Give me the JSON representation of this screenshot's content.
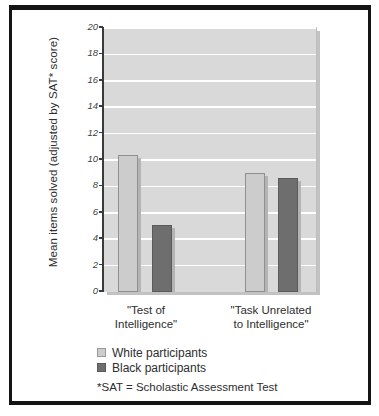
{
  "chart_data": {
    "type": "bar",
    "title": "",
    "xlabel": "",
    "ylabel": "Mean items solved (adjusted by SAT* score)",
    "ylim": [
      0,
      20
    ],
    "yticks": [
      0,
      2,
      4,
      6,
      8,
      10,
      12,
      14,
      16,
      18,
      20
    ],
    "ytick_labels": [
      "0",
      "2",
      "4",
      "6",
      "8",
      "10",
      "12",
      "14",
      "16",
      "18",
      "20"
    ],
    "grid": true,
    "legend_position": "below-axes-left",
    "categories": [
      "\"Test of Intelligence\"",
      "\"Task Unrelated to Intelligence\""
    ],
    "category_lines": [
      [
        "\"Test of",
        "Intelligence\""
      ],
      [
        "\"Task Unrelated",
        "to Intelligence\""
      ]
    ],
    "series": [
      {
        "name": "White participants",
        "color": "#cccccc",
        "values": [
          10.4,
          9.0
        ]
      },
      {
        "name": "Black participants",
        "color": "#6e6e6e",
        "values": [
          5.05,
          8.6
        ]
      }
    ],
    "annotations": [
      "*SAT = Scholastic Assessment Test"
    ]
  },
  "legend": {
    "items": [
      {
        "label": "White participants",
        "swatch": "light-gray-swatch"
      },
      {
        "label": "Black participants",
        "swatch": "dark-gray-swatch"
      }
    ]
  },
  "footnote": {
    "text": "*SAT = Scholastic Assessment Test"
  }
}
